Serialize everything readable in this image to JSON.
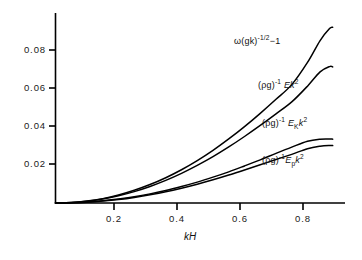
{
  "chart_data": {
    "type": "line",
    "title": "",
    "subtitle": "",
    "xlabel": "kH",
    "ylabel": "",
    "xlim": [
      0,
      0.9
    ],
    "ylim": [
      0,
      0.098
    ],
    "grid": false,
    "legend_position": "inline-curve-labels",
    "xticks": [
      "0.2",
      "0.4",
      "0.6",
      "0.8"
    ],
    "xtick_values": [
      0.2,
      0.4,
      0.6,
      0.8
    ],
    "yticks": [
      "0.02",
      "0.04",
      "0.06",
      "0.08"
    ],
    "ytick_values": [
      0.02,
      0.04,
      0.06,
      0.08
    ],
    "x": [
      0.0,
      0.05,
      0.1,
      0.15,
      0.2,
      0.25,
      0.3,
      0.35,
      0.4,
      0.45,
      0.5,
      0.55,
      0.6,
      0.65,
      0.7,
      0.75,
      0.8,
      0.84,
      0.87,
      0.88
    ],
    "series": [
      {
        "name": "omega-gk-label",
        "label_text": "ω(gk)-1/2−1",
        "values": [
          0.0,
          0.0002,
          0.001,
          0.0023,
          0.0042,
          0.0067,
          0.0097,
          0.0133,
          0.0175,
          0.0223,
          0.0277,
          0.0337,
          0.0402,
          0.0472,
          0.0546,
          0.0623,
          0.074,
          0.0855,
          0.0918,
          0.0925
        ]
      },
      {
        "name": "E-k2-label",
        "label_text": "(ρg)-1 Ek2",
        "values": [
          0.0,
          0.0002,
          0.0009,
          0.0021,
          0.0038,
          0.006,
          0.0087,
          0.0119,
          0.0156,
          0.0198,
          0.0244,
          0.0295,
          0.035,
          0.0408,
          0.0469,
          0.0532,
          0.0615,
          0.069,
          0.0718,
          0.0716
        ]
      },
      {
        "name": "EK-k2-label",
        "label_text": "(ρg)-1 EKk2",
        "values": [
          0.0,
          0.0001,
          0.0005,
          0.0012,
          0.0021,
          0.0033,
          0.0048,
          0.0066,
          0.0087,
          0.011,
          0.0136,
          0.0164,
          0.0195,
          0.0227,
          0.0261,
          0.0294,
          0.0325,
          0.0336,
          0.0337,
          0.0336
        ]
      },
      {
        "name": "Ep-k2-label",
        "label_text": "(ρg)-1 Epk2",
        "values": [
          0.0,
          0.0001,
          0.0004,
          0.001,
          0.0018,
          0.0029,
          0.0043,
          0.0059,
          0.0078,
          0.0099,
          0.0122,
          0.0147,
          0.0174,
          0.0201,
          0.0229,
          0.0256,
          0.0286,
          0.0299,
          0.0303,
          0.0302
        ]
      }
    ]
  },
  "axis": {
    "x_title": "kH",
    "y_tick_0": "0.02",
    "y_tick_1": "0.04",
    "y_tick_2": "0.06",
    "y_tick_3": "0.08",
    "x_tick_0": "0.2",
    "x_tick_1": "0.4",
    "x_tick_2": "0.6",
    "x_tick_3": "0.8"
  },
  "curve_labels": {
    "omega": {
      "lead": "ω(gk)",
      "sup": "-1/2",
      "tail": "−1"
    },
    "energy_total": {
      "lead": "(ρg)",
      "sup1": "-1",
      "sym": "Ek",
      "sup2": "2"
    },
    "energy_kinetic": {
      "lead": "(ρg)",
      "sup1": "-1",
      "sym": "E",
      "sub": "K",
      "sym2": "k",
      "sup2": "2"
    },
    "energy_potential": {
      "lead": "(ρg)",
      "sup1": "-1",
      "sym": "E",
      "sub": "p",
      "sym2": "k",
      "sup2": "2"
    }
  },
  "style": {
    "line_color": "#000000",
    "axis_color": "#000000",
    "background": "#ffffff"
  }
}
